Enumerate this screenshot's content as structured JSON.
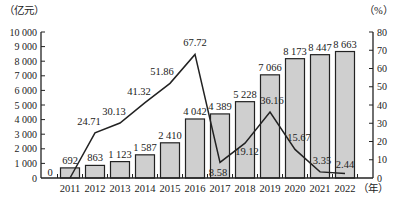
{
  "chart_data": {
    "type": "bar+line",
    "title": "",
    "categories": [
      "2011",
      "2012",
      "2013",
      "2014",
      "2015",
      "2016",
      "2017",
      "2018",
      "2019",
      "2020",
      "2021",
      "2022"
    ],
    "series": [
      {
        "name": "amount",
        "type": "bar",
        "axis": "left",
        "values": [
          692,
          863,
          1123,
          1587,
          2410,
          4042,
          4389,
          5228,
          7066,
          8173,
          8447,
          8663
        ],
        "labels": [
          "692",
          "863",
          "1 123",
          "1 587",
          "2 410",
          "4 042",
          "4 389",
          "5 228",
          "7 066",
          "8 173",
          "8 447",
          "8 663"
        ],
        "color": "#cfcfcf"
      },
      {
        "name": "growth",
        "type": "line",
        "axis": "right",
        "values": [
          0,
          24.71,
          30.13,
          41.32,
          51.86,
          67.72,
          8.58,
          19.12,
          36.16,
          15.67,
          3.35,
          2.44
        ],
        "labels": [
          "0",
          "24.71",
          "30.13",
          "41.32",
          "51.86",
          "67.72",
          "8.58",
          "19.12",
          "36.16",
          "15.67",
          "3.35",
          "2.44"
        ],
        "color": "#222222"
      }
    ],
    "left_axis": {
      "unit_label": "（亿元）",
      "ylim": [
        0,
        10000
      ],
      "ticks": [
        "0",
        "1 000",
        "2 000",
        "3 000",
        "4 000",
        "5 000",
        "6 000",
        "7 000",
        "8 000",
        "9 000",
        "10 000"
      ]
    },
    "right_axis": {
      "unit_label": "（%）",
      "ylim": [
        0,
        80
      ],
      "ticks": [
        "0",
        "10",
        "20",
        "30",
        "40",
        "50",
        "60",
        "70",
        "80"
      ]
    },
    "xlabel": "（年）",
    "grid": false,
    "legend": "none"
  }
}
